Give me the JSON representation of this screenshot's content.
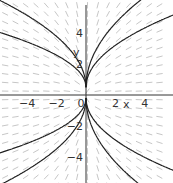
{
  "chart_data": {
    "type": "line",
    "subtype": "direction-field-with-solution-curves",
    "title": "",
    "xlabel": "x",
    "ylabel": "y",
    "xlim": [
      -5.8,
      5.8
    ],
    "ylim": [
      -5.8,
      5.8
    ],
    "x_ticks": [
      -4,
      -2,
      0,
      2,
      4
    ],
    "y_ticks": [
      4,
      2,
      -2,
      -4
    ],
    "x_tick_labels": [
      "−4",
      "−2",
      "0",
      "2",
      "4"
    ],
    "y_tick_labels": [
      "4",
      "2",
      "−2",
      "−4"
    ],
    "grid": false,
    "legend": [],
    "series": [
      {
        "name": "upper-left outer",
        "formula": "y = 2.3*sqrt(-x)",
        "side": "left",
        "C": 2.3
      },
      {
        "name": "upper-left inner",
        "formula": "y = 1.45*sqrt(-x)",
        "side": "left",
        "C": 1.45
      },
      {
        "name": "upper-right outer",
        "formula": "y = 2.9*sqrt(x)",
        "side": "right",
        "C": 2.9
      },
      {
        "name": "upper-right inner",
        "formula": "y = 1.9*sqrt(x)",
        "side": "right",
        "C": 1.9
      },
      {
        "name": "lower-left outer",
        "formula": "y = -2.3*sqrt(-x)",
        "side": "left",
        "C": -2.3
      },
      {
        "name": "lower-left inner",
        "formula": "y = -1.45*sqrt(-x)",
        "side": "left",
        "C": -1.45
      },
      {
        "name": "lower-right outer",
        "formula": "y = -2.9*sqrt(x)",
        "side": "right",
        "C": -2.9
      },
      {
        "name": "lower-right inner",
        "formula": "y = -1.9*sqrt(x)",
        "side": "right",
        "C": -1.9
      }
    ],
    "field": {
      "description": "dy/dx = y/(2x)",
      "arrow_color": "#b8b8b8"
    }
  },
  "colors": {
    "curve": "#222222",
    "axis": "#333333"
  }
}
